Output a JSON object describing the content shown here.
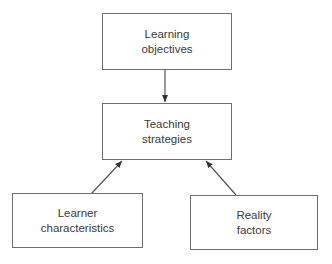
{
  "diagram": {
    "type": "flow",
    "nodes": [
      {
        "id": "learning-objectives",
        "line1": "Learning",
        "line2": "objectives"
      },
      {
        "id": "teaching-strategies",
        "line1": "Teaching",
        "line2": "strategies"
      },
      {
        "id": "learner-characteristics",
        "line1": "Learner",
        "line2": "characteristics"
      },
      {
        "id": "reality-factors",
        "line1": "Reality",
        "line2": "factors"
      }
    ],
    "edges": [
      {
        "from": "learning-objectives",
        "to": "teaching-strategies"
      },
      {
        "from": "learner-characteristics",
        "to": "teaching-strategies"
      },
      {
        "from": "reality-factors",
        "to": "teaching-strategies"
      }
    ],
    "colors": {
      "border": "#6e6e6e",
      "text": "#3a3a3a",
      "arrow": "#555555",
      "background": "#ffffff"
    }
  }
}
